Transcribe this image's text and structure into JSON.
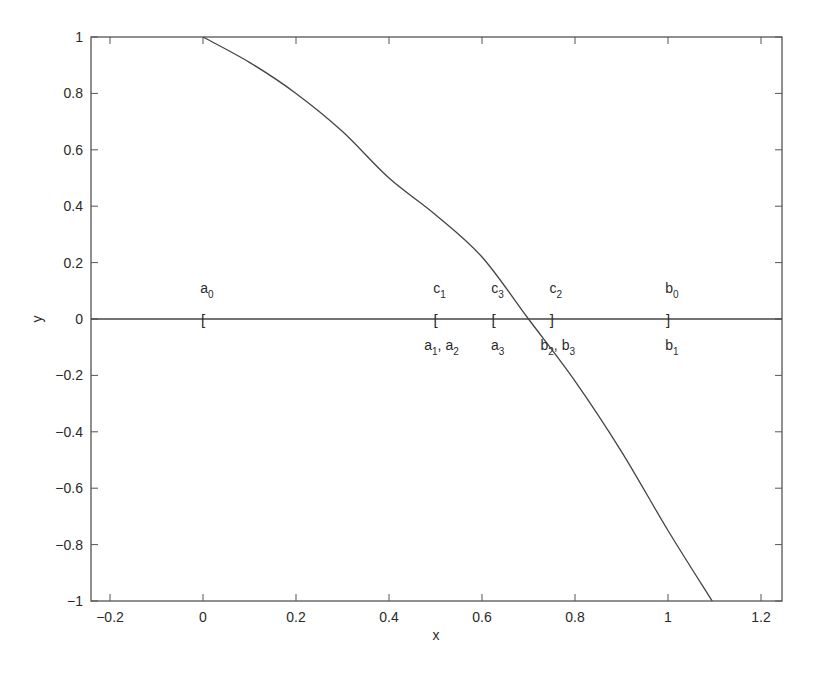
{
  "chart_data": {
    "type": "line",
    "title": "",
    "xlabel": "x",
    "ylabel": "y",
    "xlim": [
      -0.24,
      1.245
    ],
    "ylim": [
      -1,
      1
    ],
    "grid": false,
    "legend": null,
    "xticks": [
      -0.2,
      0,
      0.2,
      0.4,
      0.6,
      0.8,
      1,
      1.2
    ],
    "xtick_labels": [
      "-0.2",
      "0",
      "0.2",
      "0.4",
      "0.6",
      "0.8",
      "1",
      "1.2"
    ],
    "yticks": [
      -1,
      -0.8,
      -0.6,
      -0.4,
      -0.2,
      0,
      0.2,
      0.4,
      0.6,
      0.8,
      1
    ],
    "ytick_labels": [
      "-1",
      "-0.8",
      "-0.6",
      "-0.4",
      "-0.2",
      "0",
      "0.2",
      "0.4",
      "0.6",
      "0.8",
      "1"
    ],
    "series": [
      {
        "name": "f(x)",
        "x": [
          0,
          0.1,
          0.2,
          0.3,
          0.4,
          0.5,
          0.6,
          0.7,
          0.8,
          0.9,
          1.0,
          1.095
        ],
        "y": [
          1,
          0.91,
          0.8,
          0.665,
          0.5,
          0.37,
          0.22,
          0.0,
          -0.22,
          -0.47,
          -0.75,
          -1.0
        ]
      },
      {
        "name": "y=0 line",
        "x": [
          -0.24,
          1.245
        ],
        "y": [
          0,
          0
        ]
      }
    ],
    "annotations": [
      {
        "text": "a",
        "sub": "0",
        "x": 0,
        "position": "above"
      },
      {
        "text": "[",
        "x": 0,
        "position": "on-axis"
      },
      {
        "text": "c",
        "sub": "1",
        "x": 0.5,
        "position": "above"
      },
      {
        "text": "[",
        "x": 0.5,
        "position": "on-axis"
      },
      {
        "text": "a",
        "sub": "1",
        "text2": ", a",
        "sub2": "2",
        "x": 0.5,
        "position": "below"
      },
      {
        "text": "c",
        "sub": "3",
        "x": 0.625,
        "position": "above"
      },
      {
        "text": "[",
        "x": 0.625,
        "position": "on-axis"
      },
      {
        "text": "a",
        "sub": "3",
        "x": 0.625,
        "position": "below"
      },
      {
        "text": "c",
        "sub": "2",
        "x": 0.75,
        "position": "above"
      },
      {
        "text": "]",
        "x": 0.75,
        "position": "on-axis"
      },
      {
        "text": "b",
        "sub": "2",
        "text2": ", b",
        "sub2": "3",
        "x": 0.75,
        "position": "below"
      },
      {
        "text": "b",
        "sub": "0",
        "x": 1.0,
        "position": "above"
      },
      {
        "text": "]",
        "x": 1.0,
        "position": "on-axis"
      },
      {
        "text": "b",
        "sub": "1",
        "x": 1.0,
        "position": "below"
      }
    ]
  },
  "labels": {
    "xlabel": "x",
    "ylabel": "y"
  }
}
